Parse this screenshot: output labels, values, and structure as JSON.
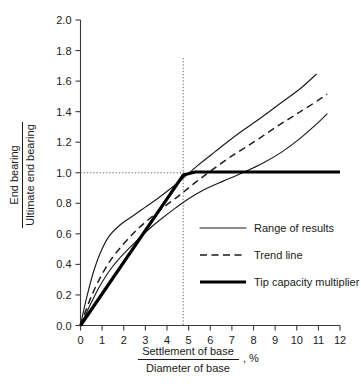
{
  "chart_data": {
    "type": "line",
    "title": "",
    "xlabel_numerator": "Settlement of base",
    "xlabel_denominator": "Diameter of base",
    "xlabel_unit": ", %",
    "ylabel_numerator": "End bearing",
    "ylabel_denominator": "Ultimate end bearing",
    "xlim": [
      0,
      12
    ],
    "ylim": [
      0.0,
      2.0
    ],
    "xticks": [
      0,
      1,
      2,
      3,
      4,
      5,
      6,
      7,
      8,
      9,
      10,
      11,
      12
    ],
    "xtick_labels": [
      "0",
      "1",
      "2",
      "3",
      "4",
      "5",
      "6",
      "7",
      "8",
      "9",
      "10",
      "11",
      "12"
    ],
    "yticks": [
      0.0,
      0.2,
      0.4,
      0.6,
      0.8,
      1.0,
      1.2,
      1.4,
      1.6,
      1.8,
      2.0
    ],
    "ytick_labels": [
      "0.0",
      "0.2",
      "0.4",
      "0.6",
      "0.8",
      "1.0",
      "1.2",
      "1.4",
      "1.6",
      "1.8",
      "2.0"
    ],
    "grid": false,
    "legend_position": "center-right",
    "annotations": {
      "vertical_guide_x": 4.75,
      "horizontal_guide_y": 1.0
    },
    "series": [
      {
        "name": "Range of results",
        "style": "solid-thin",
        "role": "upper-bound",
        "points": [
          [
            0.0,
            0.0
          ],
          [
            0.15,
            0.1
          ],
          [
            0.35,
            0.22
          ],
          [
            0.6,
            0.35
          ],
          [
            0.9,
            0.47
          ],
          [
            1.3,
            0.58
          ],
          [
            1.8,
            0.655
          ],
          [
            2.4,
            0.715
          ],
          [
            3.0,
            0.775
          ],
          [
            3.6,
            0.835
          ],
          [
            4.2,
            0.9
          ],
          [
            4.75,
            0.965
          ],
          [
            5.4,
            1.045
          ],
          [
            6.2,
            1.135
          ],
          [
            7.2,
            1.245
          ],
          [
            8.2,
            1.345
          ],
          [
            9.2,
            1.45
          ],
          [
            10.2,
            1.555
          ],
          [
            10.9,
            1.645
          ]
        ]
      },
      {
        "name": "Range of results",
        "style": "solid-thin",
        "role": "lower-bound",
        "points": [
          [
            0.0,
            0.0
          ],
          [
            0.2,
            0.06
          ],
          [
            0.5,
            0.15
          ],
          [
            0.9,
            0.26
          ],
          [
            1.4,
            0.37
          ],
          [
            2.0,
            0.47
          ],
          [
            2.6,
            0.555
          ],
          [
            3.2,
            0.635
          ],
          [
            3.8,
            0.705
          ],
          [
            4.4,
            0.77
          ],
          [
            5.0,
            0.83
          ],
          [
            5.8,
            0.895
          ],
          [
            6.6,
            0.945
          ],
          [
            7.5,
            1.0
          ],
          [
            8.4,
            1.06
          ],
          [
            9.3,
            1.135
          ],
          [
            10.2,
            1.23
          ],
          [
            11.0,
            1.33
          ],
          [
            11.4,
            1.385
          ]
        ]
      },
      {
        "name": "Trend line",
        "style": "dashed",
        "role": "trend",
        "points": [
          [
            0.0,
            0.0
          ],
          [
            0.2,
            0.08
          ],
          [
            0.5,
            0.19
          ],
          [
            0.9,
            0.31
          ],
          [
            1.4,
            0.43
          ],
          [
            2.0,
            0.535
          ],
          [
            2.6,
            0.625
          ],
          [
            3.2,
            0.7
          ],
          [
            3.9,
            0.78
          ],
          [
            4.6,
            0.855
          ],
          [
            5.3,
            0.935
          ],
          [
            6.1,
            1.02
          ],
          [
            7.0,
            1.11
          ],
          [
            8.0,
            1.2
          ],
          [
            9.0,
            1.295
          ],
          [
            10.0,
            1.385
          ],
          [
            11.0,
            1.475
          ],
          [
            11.4,
            1.515
          ]
        ]
      },
      {
        "name": "Tip capacity multiplier",
        "style": "solid-thick",
        "role": "design-multiplier",
        "points": [
          [
            0.0,
            0.0
          ],
          [
            4.75,
            0.985
          ],
          [
            5.3,
            1.005
          ],
          [
            12.0,
            1.005
          ]
        ]
      }
    ],
    "legend": [
      {
        "label": "Range of results",
        "style": "solid-thin"
      },
      {
        "label": "Trend line",
        "style": "dashed"
      },
      {
        "label": "Tip capacity multiplier",
        "style": "solid-thick"
      }
    ]
  }
}
